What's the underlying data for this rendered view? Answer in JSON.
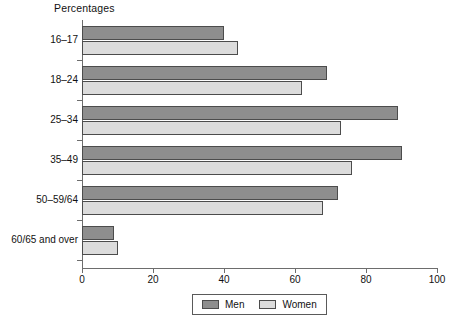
{
  "chart_data": {
    "type": "bar",
    "orientation": "horizontal",
    "title": "Percentages",
    "xlabel": "",
    "ylabel": "",
    "xlim": [
      0,
      100
    ],
    "xticks": [
      0,
      20,
      40,
      60,
      80,
      100
    ],
    "xtick_labels": [
      "0",
      "20",
      "40",
      "60",
      "80",
      "100"
    ],
    "grid": false,
    "categories": [
      "16–17",
      "18–24",
      "25–34",
      "35–49",
      "50–59/64",
      "60/65 and over"
    ],
    "series": [
      {
        "name": "Men",
        "color": "#8e8e8e",
        "values": [
          40,
          69,
          89,
          90,
          72,
          9
        ]
      },
      {
        "name": "Women",
        "color": "#dcdcdc",
        "values": [
          44,
          62,
          73,
          76,
          68,
          10
        ]
      }
    ],
    "legend": {
      "position": "bottom",
      "entries": [
        {
          "label": "Men",
          "color": "#8e8e8e"
        },
        {
          "label": "Women",
          "color": "#dcdcdc"
        }
      ]
    },
    "axis_color": "#6d6d6d",
    "bar_edge_color": "#4c4c4c"
  }
}
